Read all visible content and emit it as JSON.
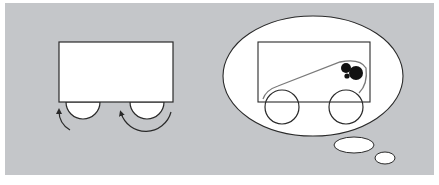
{
  "figure": {
    "colors": {
      "background": "#ffffff",
      "panel": "#c4c6c9",
      "shape_fill": "#ffffff",
      "stroke": "#2a2a2a",
      "belt": "#7a7a7a",
      "balls": "#111111"
    },
    "left_panel": {
      "label": "cart-with-spinning-wheels",
      "wheel_count": 2,
      "arrow_direction": "counterclockwise"
    },
    "right_panel": {
      "label": "thought-bubble-cart-with-belt",
      "wheel_count": 2,
      "ball_count": 3,
      "bubble_tail_ellipses": 2
    }
  }
}
